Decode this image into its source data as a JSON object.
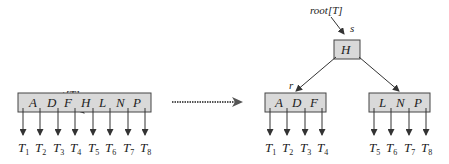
{
  "diagram": {
    "type": "b-tree-root-split",
    "before": {
      "root_label": "root[T]",
      "node_label": "r",
      "keys": [
        "A",
        "D",
        "F",
        "H",
        "L",
        "N",
        "P"
      ],
      "children": [
        {
          "base": "T",
          "sub": "1"
        },
        {
          "base": "T",
          "sub": "2"
        },
        {
          "base": "T",
          "sub": "3"
        },
        {
          "base": "T",
          "sub": "4"
        },
        {
          "base": "T",
          "sub": "5"
        },
        {
          "base": "T",
          "sub": "6"
        },
        {
          "base": "T",
          "sub": "7"
        },
        {
          "base": "T",
          "sub": "8"
        }
      ]
    },
    "transition_arrow": "dotted-right-arrow",
    "after": {
      "root_label": "root[T]",
      "root_node_label": "s",
      "root_keys": [
        "H"
      ],
      "left_node_label": "r",
      "left_keys": [
        "A",
        "D",
        "F"
      ],
      "right_keys": [
        "L",
        "N",
        "P"
      ],
      "left_children": [
        {
          "base": "T",
          "sub": "1"
        },
        {
          "base": "T",
          "sub": "2"
        },
        {
          "base": "T",
          "sub": "3"
        },
        {
          "base": "T",
          "sub": "4"
        }
      ],
      "right_children": [
        {
          "base": "T",
          "sub": "5"
        },
        {
          "base": "T",
          "sub": "6"
        },
        {
          "base": "T",
          "sub": "7"
        },
        {
          "base": "T",
          "sub": "8"
        }
      ]
    },
    "colors": {
      "node_fill": "#d9d9d9",
      "stroke": "#444444",
      "text": "#222222"
    }
  }
}
